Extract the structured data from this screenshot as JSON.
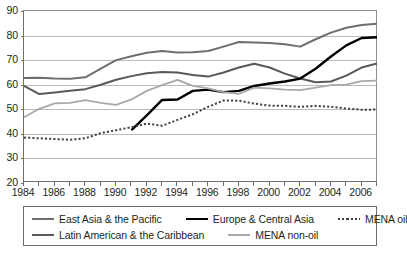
{
  "chart_data": {
    "type": "line",
    "title": "",
    "subtitle": "",
    "xlabel": "",
    "ylabel": "",
    "xlim": [
      1984,
      2007
    ],
    "ylim": [
      20,
      90
    ],
    "grid": true,
    "legend_position": "bottom",
    "y_ticks": [
      20,
      30,
      40,
      50,
      60,
      70,
      80,
      90
    ],
    "x_ticks": [
      1984,
      1985,
      1986,
      1987,
      1988,
      1989,
      1990,
      1991,
      1992,
      1993,
      1994,
      1995,
      1996,
      1997,
      1998,
      1999,
      2000,
      2001,
      2002,
      2003,
      2004,
      2005,
      2006,
      2007
    ],
    "x_tick_labels": [
      "1984",
      "",
      "1986",
      "",
      "1988",
      "",
      "1990",
      "",
      "1992",
      "",
      "1994",
      "",
      "1996",
      "",
      "1998",
      "",
      "2000",
      "",
      "2002",
      "",
      "2004",
      "",
      "2006",
      ""
    ],
    "x": [
      1984,
      1985,
      1986,
      1987,
      1988,
      1989,
      1990,
      1991,
      1992,
      1993,
      1994,
      1995,
      1996,
      1997,
      1998,
      1999,
      2000,
      2001,
      2002,
      2003,
      2004,
      2005,
      2006,
      2007
    ],
    "series": [
      {
        "name": "East Asia & the Pacific",
        "color": "#6d6e71",
        "style": "solid",
        "width": 2.0,
        "values": [
          62.7,
          62.8,
          62.5,
          62.4,
          63.0,
          66.5,
          70.0,
          71.6,
          73.0,
          73.7,
          73.1,
          73.2,
          73.7,
          75.5,
          77.4,
          77.2,
          77.0,
          76.5,
          75.5,
          78.5,
          81.2,
          83.2,
          84.3,
          84.8
        ]
      },
      {
        "name": "Latin American & the Caribbean",
        "color": "#58595b",
        "style": "solid",
        "width": 2.0,
        "values": [
          59.5,
          56.2,
          56.8,
          57.5,
          58.2,
          60.0,
          62.0,
          63.5,
          64.7,
          65.2,
          65.0,
          64.0,
          63.3,
          65.0,
          67.0,
          68.5,
          67.0,
          64.5,
          62.5,
          61.0,
          61.3,
          63.7,
          67.0,
          68.6
        ]
      },
      {
        "name": "Europe & Central Asia",
        "color": "#000000",
        "style": "solid",
        "width": 2.4,
        "values": [
          null,
          null,
          null,
          null,
          null,
          null,
          null,
          41.5,
          47.5,
          53.8,
          54.0,
          57.5,
          58.0,
          57.0,
          57.5,
          59.5,
          60.5,
          61.3,
          62.5,
          66.5,
          71.5,
          76.0,
          79.0,
          79.3
        ]
      },
      {
        "name": "MENA non-oil",
        "color": "#a7a9ac",
        "style": "solid",
        "width": 1.8,
        "values": [
          46.8,
          50.2,
          52.4,
          52.6,
          53.7,
          52.6,
          51.8,
          54.0,
          57.5,
          59.8,
          62.0,
          59.5,
          58.5,
          57.0,
          56.3,
          58.8,
          58.5,
          58.0,
          57.8,
          58.8,
          59.8,
          60.0,
          61.5,
          61.7
        ]
      },
      {
        "name": "MENA oil",
        "color": "#414042",
        "style": "dotted",
        "width": 2.0,
        "values": [
          38.5,
          38.2,
          37.9,
          37.6,
          38.2,
          40.3,
          41.5,
          42.7,
          44.2,
          43.3,
          45.7,
          48.0,
          51.0,
          53.6,
          53.5,
          52.3,
          51.5,
          51.4,
          51.0,
          51.4,
          51.0,
          50.3,
          49.8,
          49.9
        ]
      }
    ]
  },
  "legend": {
    "rows": [
      [
        {
          "label": "East Asia & the Pacific",
          "color": "#6d6e71",
          "style": "solid",
          "width": 2.0
        },
        {
          "label": "Europe & Central Asia",
          "color": "#000000",
          "style": "solid",
          "width": 2.4
        },
        {
          "label": "MENA oil",
          "color": "#414042",
          "style": "dotted",
          "width": 2.0
        }
      ],
      [
        {
          "label": "Latin American & the Caribbean",
          "color": "#58595b",
          "style": "solid",
          "width": 2.0
        },
        {
          "label": "MENA non-oil",
          "color": "#a7a9ac",
          "style": "solid",
          "width": 1.8
        }
      ]
    ]
  },
  "colors": {
    "axis": "#6d6e71",
    "grid": "#b9bbbd",
    "background": "#ffffff",
    "text": "#231f20"
  }
}
